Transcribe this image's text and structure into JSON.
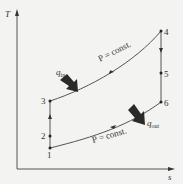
{
  "diagram": {
    "axes": {
      "y_label": "T",
      "x_label": "s"
    },
    "points": [
      {
        "id": "1",
        "label": "1",
        "x": 50,
        "y": 148
      },
      {
        "id": "2",
        "label": "2",
        "x": 50,
        "y": 136
      },
      {
        "id": "3",
        "label": "3",
        "x": 50,
        "y": 101
      },
      {
        "id": "4",
        "label": "4",
        "x": 161,
        "y": 31
      },
      {
        "id": "5",
        "label": "5",
        "x": 161,
        "y": 73
      },
      {
        "id": "6",
        "label": "6",
        "x": 161,
        "y": 102
      }
    ],
    "process_labels": {
      "upper": "P = const.",
      "lower": "P = const."
    },
    "heat": {
      "in_symbol": "q",
      "in_sub": "in",
      "out_symbol": "q",
      "out_sub": "out"
    },
    "colors": {
      "line": "#555555",
      "arrow": "#2a2a2a",
      "background": "#f3f3f1"
    }
  }
}
